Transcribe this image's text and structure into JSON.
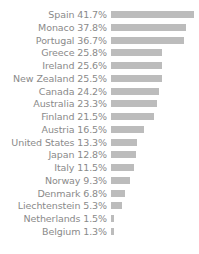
{
  "chart_data": {
    "type": "bar",
    "orientation": "horizontal",
    "title": "",
    "subtitle": "",
    "xlabel": "",
    "ylabel": "",
    "xlim": [
      0,
      41.7
    ],
    "grid": false,
    "legend": false,
    "value_suffix": "%",
    "label_format": "{category} {value}%",
    "bar_color": "#bcbcbc",
    "label_color": "#8a8a8a",
    "background_color": "#ffffff",
    "categories": [
      "Spain",
      "Monaco",
      "Portugal",
      "Greece",
      "Ireland",
      "New Zealand",
      "Canada",
      "Australia",
      "Finland",
      "Austria",
      "United States",
      "Japan",
      "Italy",
      "Norway",
      "Denmark",
      "Liechtenstein",
      "Netherlands",
      "Belgium"
    ],
    "values": [
      41.7,
      37.8,
      36.7,
      25.8,
      25.6,
      25.5,
      24.2,
      23.3,
      21.5,
      16.5,
      13.3,
      12.8,
      11.5,
      9.3,
      6.8,
      5.3,
      1.5,
      1.3
    ],
    "rows": [
      {
        "label": "Spain 41.7%",
        "category": "Spain",
        "value": 41.7
      },
      {
        "label": "Monaco 37.8%",
        "category": "Monaco",
        "value": 37.8
      },
      {
        "label": "Portugal 36.7%",
        "category": "Portugal",
        "value": 36.7
      },
      {
        "label": "Greece 25.8%",
        "category": "Greece",
        "value": 25.8
      },
      {
        "label": "Ireland 25.6%",
        "category": "Ireland",
        "value": 25.6
      },
      {
        "label": "New Zealand 25.5%",
        "category": "New Zealand",
        "value": 25.5
      },
      {
        "label": "Canada 24.2%",
        "category": "Canada",
        "value": 24.2
      },
      {
        "label": "Australia 23.3%",
        "category": "Australia",
        "value": 23.3
      },
      {
        "label": "Finland 21.5%",
        "category": "Finland",
        "value": 21.5
      },
      {
        "label": "Austria 16.5%",
        "category": "Austria",
        "value": 16.5
      },
      {
        "label": "United States 13.3%",
        "category": "United States",
        "value": 13.3
      },
      {
        "label": "Japan 12.8%",
        "category": "Japan",
        "value": 12.8
      },
      {
        "label": "Italy 11.5%",
        "category": "Italy",
        "value": 11.5
      },
      {
        "label": "Norway 9.3%",
        "category": "Norway",
        "value": 9.3
      },
      {
        "label": "Denmark 6.8%",
        "category": "Denmark",
        "value": 6.8
      },
      {
        "label": "Liechtenstein 5.3%",
        "category": "Liechtenstein",
        "value": 5.3
      },
      {
        "label": "Netherlands 1.5%",
        "category": "Netherlands",
        "value": 1.5
      },
      {
        "label": "Belgium 1.3%",
        "category": "Belgium",
        "value": 1.3
      }
    ]
  }
}
